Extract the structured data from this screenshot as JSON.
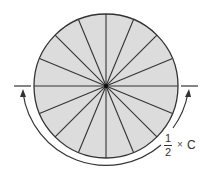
{
  "diagram": {
    "sector_count": 16,
    "colors": {
      "fill": "#dcdcdc",
      "stroke": "#333333",
      "background": "#ffffff"
    },
    "circle": {
      "cx": 106,
      "cy": 86,
      "r": 72
    },
    "label": {
      "numerator": "1",
      "denominator": "2",
      "operator": "×",
      "variable": "C"
    }
  }
}
